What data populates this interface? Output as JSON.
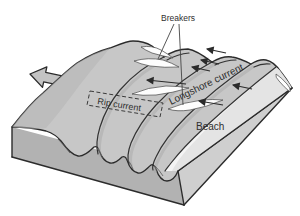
{
  "diagram": {
    "labels": {
      "breakers": "Breakers",
      "longshore_current": "Longshore current",
      "rip_current": "Rip current",
      "beach": "Beach"
    },
    "icons": {
      "offshore_arrow": "block-arrow-offshore-icon",
      "current_arrows": "longshore-current-arrow-icons"
    },
    "colors": {
      "background": "#ffffff",
      "sea_surface": "#c7c7c7",
      "beach_sand": "#e4e4e4",
      "swash_zone": "#f4f4f4",
      "left_face": "#b2b2b2",
      "right_face": "#cfcfcf",
      "outline": "#2b2b2b",
      "foam": "#fdfdfd",
      "text": "#2f2f2f"
    }
  }
}
